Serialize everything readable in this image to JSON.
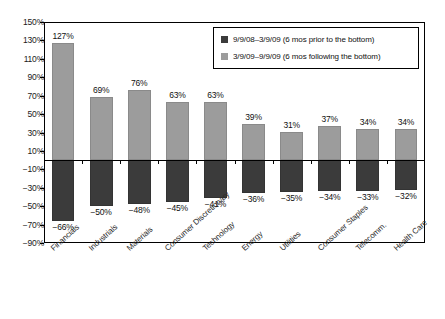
{
  "chart_data": {
    "type": "bar",
    "title": "",
    "subtitle": "",
    "xlabel": "",
    "ylabel": "",
    "ylim": [
      -90,
      150
    ],
    "ytick_step": 20,
    "grid": false,
    "legend_position": "top-right",
    "orientation": "vertical",
    "stacked": false,
    "categories": [
      "Financials",
      "Industrials",
      "Materials",
      "Consumer Discretionary",
      "Technology",
      "Energy",
      "Utilities",
      "Consumer Staples",
      "Telecomm.",
      "Health Care"
    ],
    "ytick_labels": [
      "150%",
      "130%",
      "110%",
      "90%",
      "70%",
      "50%",
      "30%",
      "10%",
      "-10%",
      "-30%",
      "-50%",
      "-70%",
      "-90%"
    ],
    "ytick_values": [
      150,
      130,
      110,
      90,
      70,
      50,
      30,
      10,
      -10,
      -30,
      -50,
      -70,
      -90
    ],
    "series": [
      {
        "name": "9/9/08–3/9/09 (6 mos prior to the bottom)",
        "color": "#3b3b3b",
        "values": [
          -66,
          -50,
          -48,
          -45,
          -41,
          -36,
          -35,
          -34,
          -33,
          -32
        ],
        "labels": [
          "−66%",
          "−50%",
          "−48%",
          "−45%",
          "−41%",
          "−36%",
          "−35%",
          "−34%",
          "−33%",
          "−32%"
        ]
      },
      {
        "name": "3/9/09–9/9/09 (6 mos following the bottom)",
        "color": "#9c9c9c",
        "values": [
          127,
          69,
          76,
          63,
          63,
          39,
          31,
          37,
          34,
          34
        ],
        "labels": [
          "127%",
          "69%",
          "76%",
          "63%",
          "63%",
          "39%",
          "31%",
          "37%",
          "34%",
          "34%"
        ]
      }
    ]
  },
  "legend": {
    "entries": [
      {
        "swatch": "dark",
        "label": "9/9/08–3/9/09 (6 mos prior to the bottom)"
      },
      {
        "swatch": "light",
        "label": "3/9/09–9/9/09 (6 mos following the bottom)"
      }
    ]
  }
}
